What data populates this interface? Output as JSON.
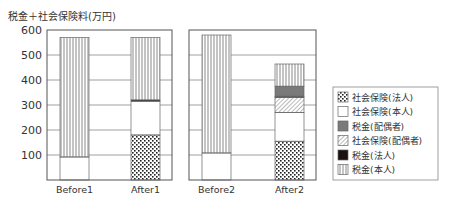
{
  "chart_data": {
    "type": "bar",
    "stacked": true,
    "title": "",
    "ylabel": "税金＋社会保険料(万円)",
    "xlabel": "",
    "ylim": [
      0,
      600
    ],
    "yticks": [
      100,
      200,
      300,
      400,
      500,
      600
    ],
    "grid": true,
    "legend_position": "right",
    "panels": [
      {
        "categories": [
          "Before1",
          "After1"
        ]
      },
      {
        "categories": [
          "Before2",
          "After2"
        ]
      }
    ],
    "categories": [
      "Before1",
      "After1",
      "Before2",
      "After2"
    ],
    "series": [
      {
        "name": "社会保険(法人)",
        "pattern": "dots",
        "values": [
          0,
          180,
          0,
          155
        ]
      },
      {
        "name": "社会保険(本人)",
        "pattern": "white",
        "values": [
          92,
          135,
          108,
          115
        ]
      },
      {
        "name": "社会保険(配偶者)",
        "pattern": "hatch",
        "values": [
          0,
          0,
          0,
          60
        ]
      },
      {
        "name": "税金(法人)",
        "pattern": "black",
        "values": [
          0,
          5,
          0,
          5
        ]
      },
      {
        "name": "税金(配偶者)",
        "pattern": "gray",
        "values": [
          0,
          0,
          0,
          40
        ]
      },
      {
        "name": "税金(本人)",
        "pattern": "vertical-lines",
        "values": [
          478,
          250,
          472,
          89
        ]
      }
    ],
    "totals": [
      570,
      570,
      580,
      464
    ],
    "legend_order": [
      "社会保険(法人)",
      "社会保険(本人)",
      "税金(配偶者)",
      "社会保険(配偶者)",
      "税金(法人)",
      "税金(本人)"
    ]
  },
  "colors": {
    "axis": "#555555",
    "grid": "#888888",
    "gray_fill": "#7a7a7a",
    "black_fill": "#1a1010",
    "lines": "#8a8a8a"
  }
}
